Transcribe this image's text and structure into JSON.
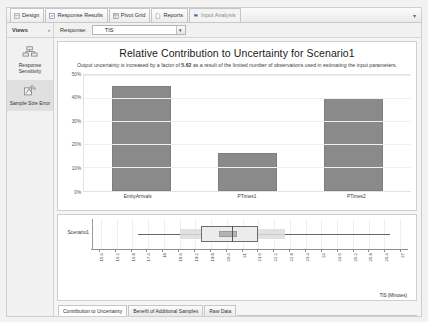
{
  "window": {
    "ribbon_collapse_icon": "chevron-down-icon"
  },
  "ribbon": {
    "tabs": [
      {
        "label": "Design",
        "icon": "design-icon",
        "active": false
      },
      {
        "label": "Response Results",
        "icon": "response-results-icon",
        "active": false
      },
      {
        "label": "Pivot Grid",
        "icon": "pivot-grid-icon",
        "active": false
      },
      {
        "label": "Reports",
        "icon": "reports-icon",
        "active": false
      },
      {
        "label": "Input Analysis",
        "icon": "input-analysis-icon",
        "active": true
      }
    ]
  },
  "toolbar": {
    "views_label": "Views",
    "views_pin_icon": "pin-icon",
    "response_label": "Response:",
    "response_value": "TIS",
    "response_dropdown_icon": "chevron-down-icon"
  },
  "sidebar": {
    "items": [
      {
        "label": "Response Sensitivity",
        "icon": "response-sensitivity-icon",
        "selected": false
      },
      {
        "label": "Sample Size Error",
        "icon": "sample-size-error-icon",
        "selected": true
      }
    ]
  },
  "chart_data": {
    "type": "bar",
    "title": "Relative Contribution to Uncertainty for Scenario1",
    "subtitle_pre": "Output uncertainty is increased by a factor of ",
    "subtitle_factor": "5.62",
    "subtitle_post": " as a result of the limited number of observations used in estimating the input parameters.",
    "categories": [
      "EntityArrivals",
      "PTimes1",
      "PTimes2"
    ],
    "values": [
      45,
      16,
      40
    ],
    "value_labels": [
      "45%",
      "16%",
      "40%"
    ],
    "ytick_labels": [
      "0%",
      "10%",
      "20%",
      "30%",
      "40%",
      "50%"
    ],
    "ytick_values": [
      0,
      10,
      20,
      30,
      40,
      50
    ],
    "ylim": [
      0,
      50
    ],
    "xlabel": "",
    "ylabel": "",
    "grid": true,
    "legend": "none",
    "bar_color": "#8a8a8a"
  },
  "boxplot": {
    "type": "box",
    "category": "Scenario1",
    "xlabel": "TIS (Minutes)",
    "xlim": [
      15.3,
      27.3
    ],
    "tick_labels": [
      "15.6",
      "16.2",
      "16.8",
      "17.4",
      "18",
      "18.6",
      "19.2",
      "19.8",
      "20.4",
      "21",
      "21.6",
      "22.2",
      "22.8",
      "23.4",
      "24",
      "24.6",
      "25.2",
      "25.8",
      "26.4",
      "27"
    ],
    "tick_values": [
      15.6,
      16.2,
      16.8,
      17.4,
      18,
      18.6,
      19.2,
      19.8,
      20.4,
      21,
      21.6,
      22.2,
      22.8,
      23.4,
      24,
      24.6,
      25.2,
      25.8,
      26.4,
      27
    ],
    "whisker_min": 17.0,
    "whisker_max": 26.6,
    "band_min": 18.6,
    "band_max": 22.6,
    "box_q1": 19.4,
    "box_q3": 21.6,
    "median": 20.6,
    "mean_min": 20.1,
    "mean_max": 20.8
  },
  "bottom_tabs": [
    {
      "label": "Contribution to Uncertainty",
      "active": true
    },
    {
      "label": "Benefit of Additional Samples",
      "active": false
    },
    {
      "label": "Raw Data",
      "active": false
    }
  ]
}
